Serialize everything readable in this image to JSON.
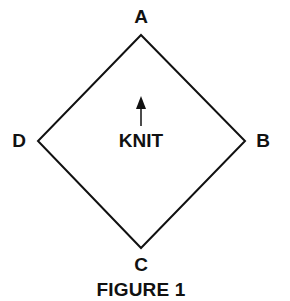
{
  "figure": {
    "caption": "FIGURE 1",
    "center_label": "KNIT",
    "arrow_direction": "up",
    "shape": "diamond",
    "colors": {
      "stroke": "#111111",
      "background": "#ffffff"
    },
    "vertices": {
      "top": {
        "label": "A"
      },
      "right": {
        "label": "B"
      },
      "bottom": {
        "label": "C"
      },
      "left": {
        "label": "D"
      }
    }
  }
}
